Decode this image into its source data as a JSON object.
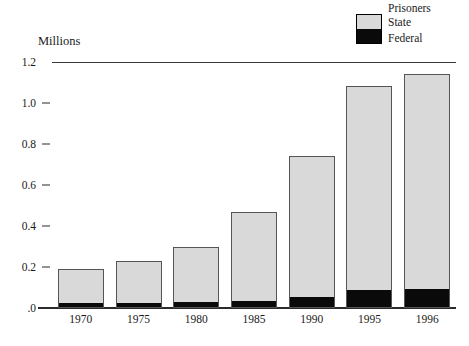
{
  "legend": {
    "title": "Prisoners",
    "entries": [
      {
        "label": "State",
        "color": "#d9d9d9"
      },
      {
        "label": "Federal",
        "color": "#0a0a0a"
      }
    ]
  },
  "axis": {
    "y_title": "Millions",
    "y_ticklabels": [
      "1.2",
      "1.0",
      "0.8",
      "0.6",
      "0.4",
      "0.2",
      ".0"
    ],
    "y_tickvalues": [
      1.2,
      1.0,
      0.8,
      0.6,
      0.4,
      0.2,
      0.0
    ]
  },
  "chart_data": {
    "type": "bar",
    "stacked": true,
    "title": "",
    "xlabel": "",
    "ylabel": "Millions",
    "ylim": [
      0,
      1.2
    ],
    "grid": false,
    "legend_position": "top-right",
    "categories": [
      "1970",
      "1975",
      "1980",
      "1985",
      "1990",
      "1995",
      "1996"
    ],
    "series": [
      {
        "name": "State",
        "color": "#d9d9d9",
        "values": [
          0.17,
          0.21,
          0.28,
          0.44,
          0.69,
          1.0,
          1.05
        ]
      },
      {
        "name": "Federal",
        "color": "#0a0a0a",
        "values": [
          0.02,
          0.02,
          0.024,
          0.03,
          0.05,
          0.085,
          0.09
        ]
      }
    ],
    "totals": [
      0.19,
      0.23,
      0.3,
      0.47,
      0.74,
      1.085,
      1.14
    ]
  }
}
